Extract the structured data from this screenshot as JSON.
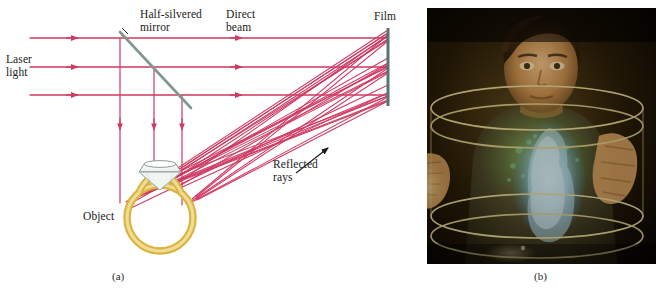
{
  "figure": {
    "type": "physics-diagram-plus-photograph",
    "topic": "Holography: making a hologram and viewing a hologram",
    "panels": [
      {
        "id": "a",
        "caption": "(a)",
        "kind": "ray-diagram"
      },
      {
        "id": "b",
        "caption": "(b)",
        "kind": "photograph"
      }
    ]
  },
  "diagram": {
    "labels": {
      "laser_light": "Laser\nlight",
      "half_silvered_mirror": "Half-silvered\nmirror",
      "direct_beam": "Direct\nbeam",
      "film": "Film",
      "reflected_rays": "Reflected\nrays",
      "object": "Object"
    },
    "colors": {
      "laser_ray": "#cf3a62",
      "mirror": "#7e998f",
      "film": "#56756f",
      "ring_gold": "#d9b442",
      "ring_fill": "#f4e4a8",
      "gem_outline": "#8f9a96",
      "gem_fill": "#eef3f1",
      "text": "#1a1a1a",
      "background": "#ffffff"
    },
    "geometry": {
      "beam_y_positions": [
        38,
        67,
        95
      ],
      "beam_x_start": 30,
      "film_x": 388,
      "film_y_top": 28,
      "film_y_bottom": 106,
      "mirror_from": [
        120,
        32
      ],
      "mirror_to": [
        191,
        108
      ],
      "vertical_ray_x": [
        120,
        154,
        182
      ],
      "ring_center": [
        160,
        218
      ],
      "ring_radius": 33,
      "arrow_from": [
        296,
        172
      ],
      "arrow_to": [
        327,
        149
      ]
    }
  },
  "photograph": {
    "caption": "(b)",
    "description": "Person behind a cylindrical glass container viewing a blue-green hologram",
    "colors": {
      "background": "#000000",
      "cylinder_ring": "#d6c98a",
      "hologram_blue": "#9fd6ef",
      "hologram_green": "#5fae5a",
      "skin": "#d8a169",
      "hair": "#2c1a10"
    },
    "frame": {
      "x": 427,
      "y": 8,
      "width": 229,
      "height": 256
    }
  }
}
